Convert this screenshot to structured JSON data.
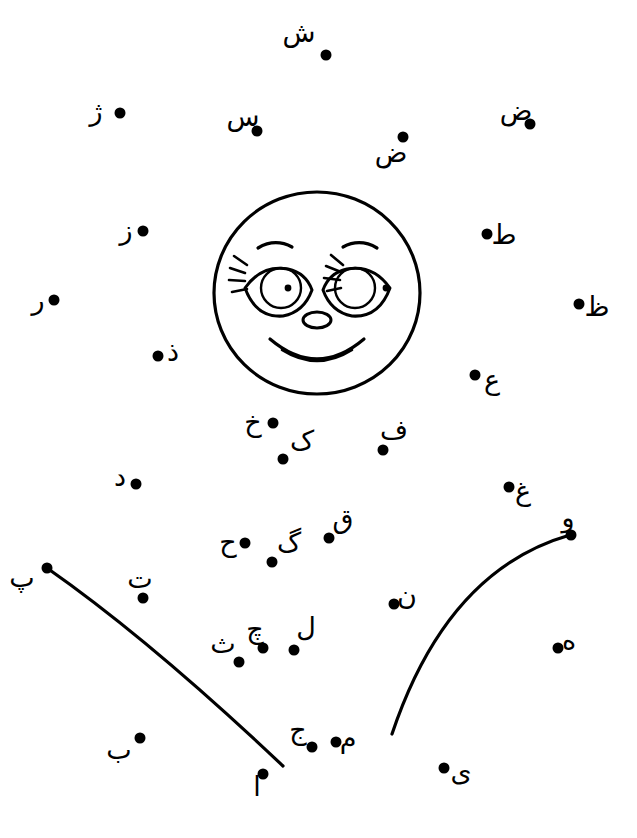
{
  "page": {
    "background_color": "#ffffff",
    "ink_color": "#000000",
    "width": 637,
    "height": 838
  },
  "face": {
    "name": "smiling-face-drawing",
    "center_x": 317,
    "center_y": 293,
    "radius_x": 103,
    "radius_y": 101
  },
  "curves": [
    {
      "name": "left-arc",
      "start_x": 47,
      "start_y": 568,
      "end_x": 283,
      "end_y": 766,
      "control_x": 150,
      "control_y": 640
    },
    {
      "name": "right-arc",
      "start_x": 570,
      "start_y": 535,
      "end_x": 392,
      "end_y": 734,
      "control_x": 447,
      "control_y": 570
    }
  ],
  "points": [
    {
      "letter": "ش",
      "name": "shin",
      "lx": 299,
      "ly": 32,
      "dx": 326,
      "dy": 55
    },
    {
      "letter": "ژ",
      "name": "zheh",
      "lx": 96,
      "ly": 110,
      "dx": 120,
      "dy": 113
    },
    {
      "letter": "س",
      "name": "seen",
      "lx": 243,
      "ly": 116,
      "dx": 257,
      "dy": 131
    },
    {
      "letter": "ض",
      "name": "zad-upper-right",
      "lx": 516,
      "ly": 110,
      "dx": 530,
      "dy": 124
    },
    {
      "letter": "ض",
      "name": "zad-upper-mid",
      "lx": 391,
      "ly": 152,
      "dx": 403,
      "dy": 137
    },
    {
      "letter": "ز",
      "name": "zeh",
      "lx": 126,
      "ly": 229,
      "dx": 143,
      "dy": 231
    },
    {
      "letter": "ط",
      "name": "ta",
      "lx": 504,
      "ly": 234,
      "dx": 487,
      "dy": 234
    },
    {
      "letter": "ر",
      "name": "reh",
      "lx": 38,
      "ly": 299,
      "dx": 54,
      "dy": 300
    },
    {
      "letter": "ظ",
      "name": "za",
      "lx": 597,
      "ly": 306,
      "dx": 579,
      "dy": 304
    },
    {
      "letter": "ذ",
      "name": "zal",
      "lx": 173,
      "ly": 351,
      "dx": 158,
      "dy": 356
    },
    {
      "letter": "ع",
      "name": "ayn",
      "lx": 492,
      "ly": 379,
      "dx": 475,
      "dy": 375
    },
    {
      "letter": "خ",
      "name": "kheh",
      "lx": 253,
      "ly": 421,
      "dx": 273,
      "dy": 423
    },
    {
      "letter": "ف",
      "name": "feh",
      "lx": 394,
      "ly": 429,
      "dx": 383,
      "dy": 450
    },
    {
      "letter": "ک",
      "name": "kaf",
      "lx": 302,
      "ly": 440,
      "dx": 283,
      "dy": 459
    },
    {
      "letter": "د",
      "name": "dal",
      "lx": 120,
      "ly": 476,
      "dx": 136,
      "dy": 484
    },
    {
      "letter": "غ",
      "name": "ghayn",
      "lx": 523,
      "ly": 490,
      "dx": 509,
      "dy": 487
    },
    {
      "letter": "ق",
      "name": "qaf",
      "lx": 343,
      "ly": 518,
      "dx": 329,
      "dy": 538
    },
    {
      "letter": "و",
      "name": "vav",
      "lx": 568,
      "ly": 517,
      "dx": 571,
      "dy": 535
    },
    {
      "letter": "ح",
      "name": "heh-jimi",
      "lx": 228,
      "ly": 541,
      "dx": 245,
      "dy": 543
    },
    {
      "letter": "گ",
      "name": "gaf",
      "lx": 289,
      "ly": 542,
      "dx": 272,
      "dy": 562
    },
    {
      "letter": "پ",
      "name": "peh",
      "lx": 22,
      "ly": 577,
      "dx": 47,
      "dy": 568
    },
    {
      "letter": "ت",
      "name": "teh",
      "lx": 140,
      "ly": 578,
      "dx": 143,
      "dy": 598
    },
    {
      "letter": "ن",
      "name": "noon",
      "lx": 407,
      "ly": 595,
      "dx": 394,
      "dy": 604
    },
    {
      "letter": "ه",
      "name": "heh",
      "lx": 569,
      "ly": 639,
      "dx": 558,
      "dy": 648
    },
    {
      "letter": "چ",
      "name": "cheh",
      "lx": 255,
      "ly": 628,
      "dx": 263,
      "dy": 648
    },
    {
      "letter": "ل",
      "name": "lam",
      "lx": 306,
      "ly": 627,
      "dx": 294,
      "dy": 650
    },
    {
      "letter": "ث",
      "name": "seh",
      "lx": 223,
      "ly": 643,
      "dx": 239,
      "dy": 662
    },
    {
      "letter": "ج",
      "name": "jim",
      "lx": 298,
      "ly": 729,
      "dx": 312,
      "dy": 747
    },
    {
      "letter": "م",
      "name": "mim",
      "lx": 348,
      "ly": 738,
      "dx": 336,
      "dy": 742
    },
    {
      "letter": "ب",
      "name": "beh",
      "lx": 119,
      "ly": 749,
      "dx": 140,
      "dy": 738
    },
    {
      "letter": "ی",
      "name": "yeh",
      "lx": 461,
      "ly": 771,
      "dx": 444,
      "dy": 768
    },
    {
      "letter": "ا",
      "name": "alef",
      "lx": 257,
      "ly": 786,
      "dx": 263,
      "dy": 774
    }
  ]
}
